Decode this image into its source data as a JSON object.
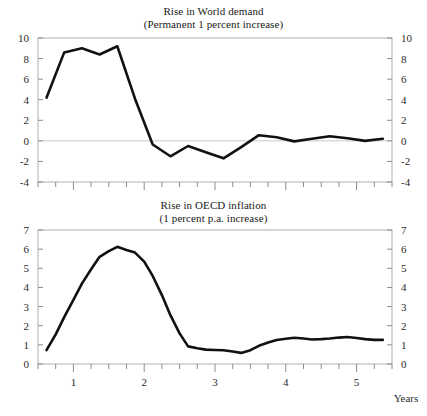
{
  "figure": {
    "width": 427,
    "height": 416,
    "background": "#ffffff",
    "line_color": "#111111",
    "frame_color": "#b0b0b0",
    "zero_line_color": "#c9c9c9"
  },
  "chart_data": [
    {
      "type": "line",
      "id": "world-demand",
      "title": "Rise in World demand",
      "subtitle": "(Permanent 1 percent increase)",
      "xlabel": "",
      "ylabel": "",
      "xlim": [
        0.5,
        5.5
      ],
      "ylim": [
        -4,
        10
      ],
      "yticks": [
        -4,
        -2,
        0,
        2,
        4,
        6,
        8,
        10
      ],
      "ytick_labels": [
        "-4",
        "-2",
        "0",
        "2",
        "4",
        "6",
        "8",
        "10"
      ],
      "ytick_labels_right": [
        "-4",
        "-2",
        "0",
        "2",
        "4",
        "6",
        "8",
        "10"
      ],
      "xticks": [
        0.5,
        0.75,
        1,
        1.25,
        1.5,
        1.75,
        2,
        2.25,
        2.5,
        2.75,
        3,
        3.25,
        3.5,
        3.75,
        4,
        4.25,
        4.5,
        4.75,
        5,
        5.25,
        5.5
      ],
      "xtick_labels": [],
      "grid": false,
      "legend": "none",
      "zero_line": true,
      "x": [
        0.62,
        0.87,
        1.12,
        1.37,
        1.62,
        1.87,
        2.12,
        2.37,
        2.62,
        2.87,
        3.12,
        3.37,
        3.62,
        3.87,
        4.12,
        4.37,
        4.62,
        4.87,
        5.12,
        5.37
      ],
      "values": [
        4.2,
        8.6,
        9.0,
        8.4,
        9.2,
        4.1,
        -0.35,
        -1.5,
        -0.5,
        -1.1,
        -1.7,
        -0.6,
        0.55,
        0.35,
        -0.05,
        0.2,
        0.45,
        0.25,
        0.0,
        0.2
      ]
    },
    {
      "type": "line",
      "id": "oecd-inflation",
      "title": "Rise in OECD inflation",
      "subtitle": "(1 percent p.a. increase)",
      "xlabel": "Years",
      "ylabel": "",
      "xlim": [
        0.5,
        5.5
      ],
      "ylim": [
        0,
        7
      ],
      "yticks": [
        0,
        1,
        2,
        3,
        4,
        5,
        6,
        7
      ],
      "ytick_labels": [
        "0",
        "1",
        "2",
        "3",
        "4",
        "5",
        "6",
        "7"
      ],
      "ytick_labels_right": [
        "0",
        "1",
        "2",
        "3",
        "4",
        "5",
        "6",
        "7"
      ],
      "xticks": [
        0.5,
        0.75,
        1,
        1.25,
        1.5,
        1.75,
        2,
        2.25,
        2.5,
        2.75,
        3,
        3.25,
        3.5,
        3.75,
        4,
        4.25,
        4.5,
        4.75,
        5,
        5.25,
        5.5
      ],
      "xtick_labels": [
        "1",
        "2",
        "3",
        "4",
        "5"
      ],
      "xtick_label_positions": [
        1,
        2,
        3,
        4,
        5
      ],
      "grid": false,
      "legend": "none",
      "zero_line": false,
      "x": [
        0.62,
        0.75,
        0.87,
        1.0,
        1.12,
        1.25,
        1.37,
        1.5,
        1.62,
        1.75,
        1.87,
        2.0,
        2.12,
        2.25,
        2.37,
        2.5,
        2.62,
        2.75,
        2.87,
        3.0,
        3.12,
        3.25,
        3.37,
        3.5,
        3.62,
        3.75,
        3.87,
        4.0,
        4.12,
        4.25,
        4.37,
        4.5,
        4.62,
        4.75,
        4.87,
        5.0,
        5.12,
        5.25,
        5.37
      ],
      "values": [
        0.72,
        1.55,
        2.45,
        3.35,
        4.2,
        4.95,
        5.6,
        5.9,
        6.12,
        5.95,
        5.82,
        5.35,
        4.6,
        3.6,
        2.55,
        1.6,
        0.92,
        0.82,
        0.75,
        0.73,
        0.72,
        0.65,
        0.58,
        0.72,
        0.95,
        1.12,
        1.25,
        1.32,
        1.37,
        1.33,
        1.28,
        1.3,
        1.33,
        1.38,
        1.41,
        1.36,
        1.3,
        1.26,
        1.26
      ]
    }
  ]
}
